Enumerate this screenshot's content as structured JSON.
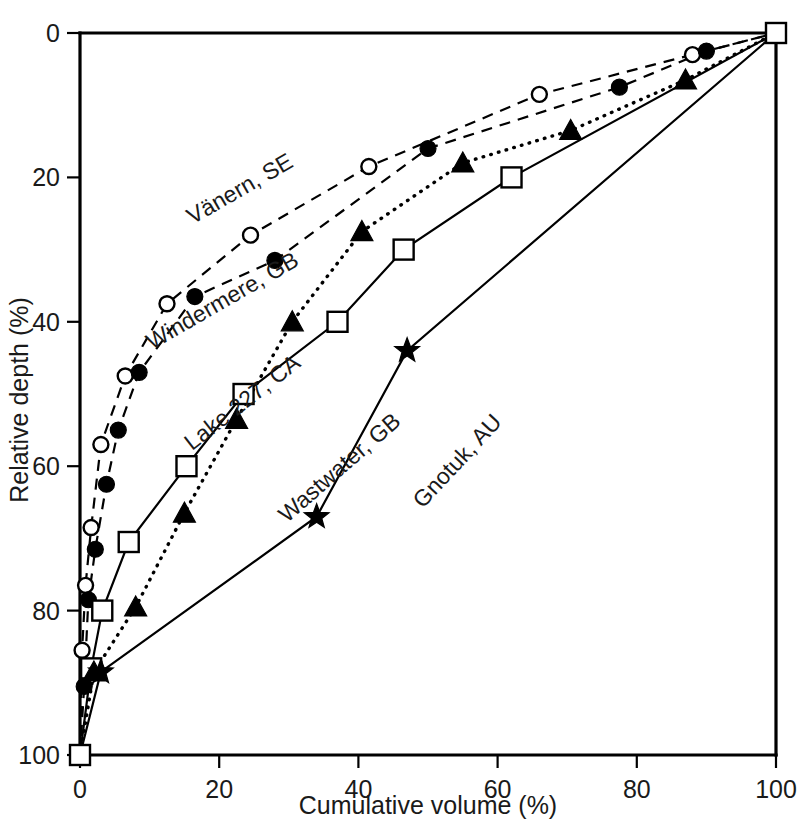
{
  "chart_data": {
    "type": "line",
    "title": "",
    "xlabel": "Cumulative volume (%)",
    "ylabel": "Relative depth (%)",
    "xlim": [
      0,
      100
    ],
    "ylim": [
      0,
      100
    ],
    "y_inverted": true,
    "grid": false,
    "legend_position": "inline-curve-labels",
    "xticks": [
      0,
      20,
      40,
      60,
      80,
      100
    ],
    "yticks": [
      0,
      20,
      40,
      60,
      80,
      100
    ],
    "xtick_labels": [
      "0",
      "20",
      "40",
      "60",
      "80",
      "100"
    ],
    "ytick_labels": [
      "0",
      "20",
      "40",
      "60",
      "80",
      "100"
    ],
    "series": [
      {
        "name": "Vänern, SE",
        "marker": "open-circle",
        "line": "dashed",
        "label_x": 23.5,
        "label_y": 22.5,
        "label_angle": -30,
        "points": [
          {
            "x": 0,
            "y": 100
          },
          {
            "x": 0.3,
            "y": 85.5
          },
          {
            "x": 0.8,
            "y": 76.5
          },
          {
            "x": 1.6,
            "y": 68.5
          },
          {
            "x": 3.0,
            "y": 57.0
          },
          {
            "x": 6.5,
            "y": 47.5
          },
          {
            "x": 12.5,
            "y": 37.5
          },
          {
            "x": 24.5,
            "y": 28.0
          },
          {
            "x": 41.5,
            "y": 18.5
          },
          {
            "x": 66.0,
            "y": 8.5
          },
          {
            "x": 88.0,
            "y": 3.0
          },
          {
            "x": 100,
            "y": 0
          }
        ]
      },
      {
        "name": "Windermere, GB",
        "marker": "filled-circle",
        "line": "dashed",
        "label_x": 21.0,
        "label_y": 38.0,
        "label_angle": -30,
        "points": [
          {
            "x": 0,
            "y": 100
          },
          {
            "x": 0.6,
            "y": 90.5
          },
          {
            "x": 1.2,
            "y": 78.5
          },
          {
            "x": 2.2,
            "y": 71.5
          },
          {
            "x": 3.8,
            "y": 62.5
          },
          {
            "x": 5.5,
            "y": 55.0
          },
          {
            "x": 8.5,
            "y": 47.0
          },
          {
            "x": 16.5,
            "y": 36.5
          },
          {
            "x": 28.0,
            "y": 31.5
          },
          {
            "x": 50.0,
            "y": 16.0
          },
          {
            "x": 77.5,
            "y": 7.5
          },
          {
            "x": 90.0,
            "y": 2.5
          },
          {
            "x": 100,
            "y": 0
          }
        ]
      },
      {
        "name": "Lake 227, CA",
        "marker": "open-square",
        "line": "solid",
        "label_x": 24.0,
        "label_y": 52.0,
        "label_angle": -38,
        "points": [
          {
            "x": 0,
            "y": 100
          },
          {
            "x": 1.6,
            "y": 88.0
          },
          {
            "x": 3.2,
            "y": 80.0
          },
          {
            "x": 7.0,
            "y": 70.5
          },
          {
            "x": 15.3,
            "y": 60.0
          },
          {
            "x": 23.5,
            "y": 50.0
          },
          {
            "x": 37.0,
            "y": 40.0
          },
          {
            "x": 46.5,
            "y": 30.0
          },
          {
            "x": 62.0,
            "y": 20.0
          },
          {
            "x": 100,
            "y": 0
          }
        ]
      },
      {
        "name": "Wastwater, GB",
        "marker": "filled-triangle",
        "line": "dotted",
        "label_x": 38.0,
        "label_y": 61.0,
        "label_angle": -41,
        "points": [
          {
            "x": 0,
            "y": 100
          },
          {
            "x": 2.0,
            "y": 88.5
          },
          {
            "x": 8.0,
            "y": 79.5
          },
          {
            "x": 15.0,
            "y": 66.5
          },
          {
            "x": 22.5,
            "y": 53.5
          },
          {
            "x": 30.5,
            "y": 40.0
          },
          {
            "x": 40.5,
            "y": 27.5
          },
          {
            "x": 55.0,
            "y": 18.0
          },
          {
            "x": 70.5,
            "y": 13.5
          },
          {
            "x": 87.0,
            "y": 6.5
          },
          {
            "x": 100,
            "y": 0
          }
        ]
      },
      {
        "name": "Gnotuk, AU",
        "marker": "filled-star",
        "line": "solid",
        "label_x": 55.0,
        "label_y": 60.0,
        "label_angle": -47,
        "points": [
          {
            "x": 0,
            "y": 100
          },
          {
            "x": 3.0,
            "y": 88.5
          },
          {
            "x": 34.0,
            "y": 67.0
          },
          {
            "x": 47.0,
            "y": 44.0
          },
          {
            "x": 100,
            "y": 0
          }
        ]
      }
    ]
  },
  "plot_geometry": {
    "left": 80,
    "right": 776,
    "top": 33,
    "bottom": 755
  }
}
